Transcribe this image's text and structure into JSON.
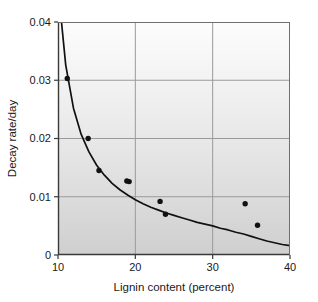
{
  "chart_data": {
    "type": "scatter",
    "title": "",
    "subtitle": "",
    "xlabel": "Lignin content (percent)",
    "ylabel": "Decay rate/day",
    "xlim": [
      10,
      40
    ],
    "ylim": [
      0,
      0.04
    ],
    "xticks": [
      10,
      20,
      30,
      40
    ],
    "xtick_labels": [
      "10",
      "20",
      "30",
      "40"
    ],
    "yticks": [
      0,
      0.01,
      0.02,
      0.03,
      0.04
    ],
    "ytick_labels": [
      "0",
      "0.01",
      "0.02",
      "0.03",
      "0.04"
    ],
    "grid": true,
    "grid_axis": "both",
    "legend": "none",
    "series": [
      {
        "name": "Observed decay rate",
        "type": "scatter",
        "marker": "filled-circle",
        "color": "#111111",
        "points": [
          {
            "x": 11.2,
            "y": 0.0303
          },
          {
            "x": 13.9,
            "y": 0.02
          },
          {
            "x": 15.3,
            "y": 0.0145
          },
          {
            "x": 18.9,
            "y": 0.0127
          },
          {
            "x": 19.2,
            "y": 0.0126
          },
          {
            "x": 23.2,
            "y": 0.0092
          },
          {
            "x": 23.9,
            "y": 0.007
          },
          {
            "x": 34.2,
            "y": 0.0088
          },
          {
            "x": 35.8,
            "y": 0.0051
          }
        ]
      },
      {
        "name": "Fitted curve",
        "type": "line",
        "color": "#111111",
        "curve_form": "power",
        "points": [
          {
            "x": 10.45,
            "y": 0.04
          },
          {
            "x": 11.0,
            "y": 0.0326
          },
          {
            "x": 12.0,
            "y": 0.0252
          },
          {
            "x": 13.0,
            "y": 0.0207
          },
          {
            "x": 14.0,
            "y": 0.0177
          },
          {
            "x": 15.0,
            "y": 0.0154
          },
          {
            "x": 16.0,
            "y": 0.0137
          },
          {
            "x": 17.0,
            "y": 0.0123
          },
          {
            "x": 18.0,
            "y": 0.0112
          },
          {
            "x": 19.0,
            "y": 0.0103
          },
          {
            "x": 20.0,
            "y": 0.0095
          },
          {
            "x": 21.0,
            "y": 0.0088
          },
          {
            "x": 22.0,
            "y": 0.0082
          },
          {
            "x": 23.0,
            "y": 0.0077
          },
          {
            "x": 24.0,
            "y": 0.0072
          },
          {
            "x": 25.0,
            "y": 0.0068
          },
          {
            "x": 26.0,
            "y": 0.0064
          },
          {
            "x": 27.0,
            "y": 0.006
          },
          {
            "x": 28.0,
            "y": 0.0056
          },
          {
            "x": 29.0,
            "y": 0.0053
          },
          {
            "x": 30.0,
            "y": 0.005
          },
          {
            "x": 31.0,
            "y": 0.0046
          },
          {
            "x": 32.0,
            "y": 0.0043
          },
          {
            "x": 33.0,
            "y": 0.0039
          },
          {
            "x": 34.0,
            "y": 0.0036
          },
          {
            "x": 35.0,
            "y": 0.0032
          },
          {
            "x": 36.0,
            "y": 0.0028
          },
          {
            "x": 37.0,
            "y": 0.0024
          },
          {
            "x": 38.0,
            "y": 0.0021
          },
          {
            "x": 39.0,
            "y": 0.0018
          },
          {
            "x": 40.0,
            "y": 0.0016
          }
        ]
      }
    ],
    "style": {
      "plot_bg_top": "#fdfdfd",
      "plot_bg_bottom": "#cfcfcf",
      "grid_color": "#9a9a9a",
      "axis_color": "#3a3a3a",
      "marker_color": "#111111",
      "curve_color": "#111111",
      "figure_bg": "#ffffff"
    }
  }
}
